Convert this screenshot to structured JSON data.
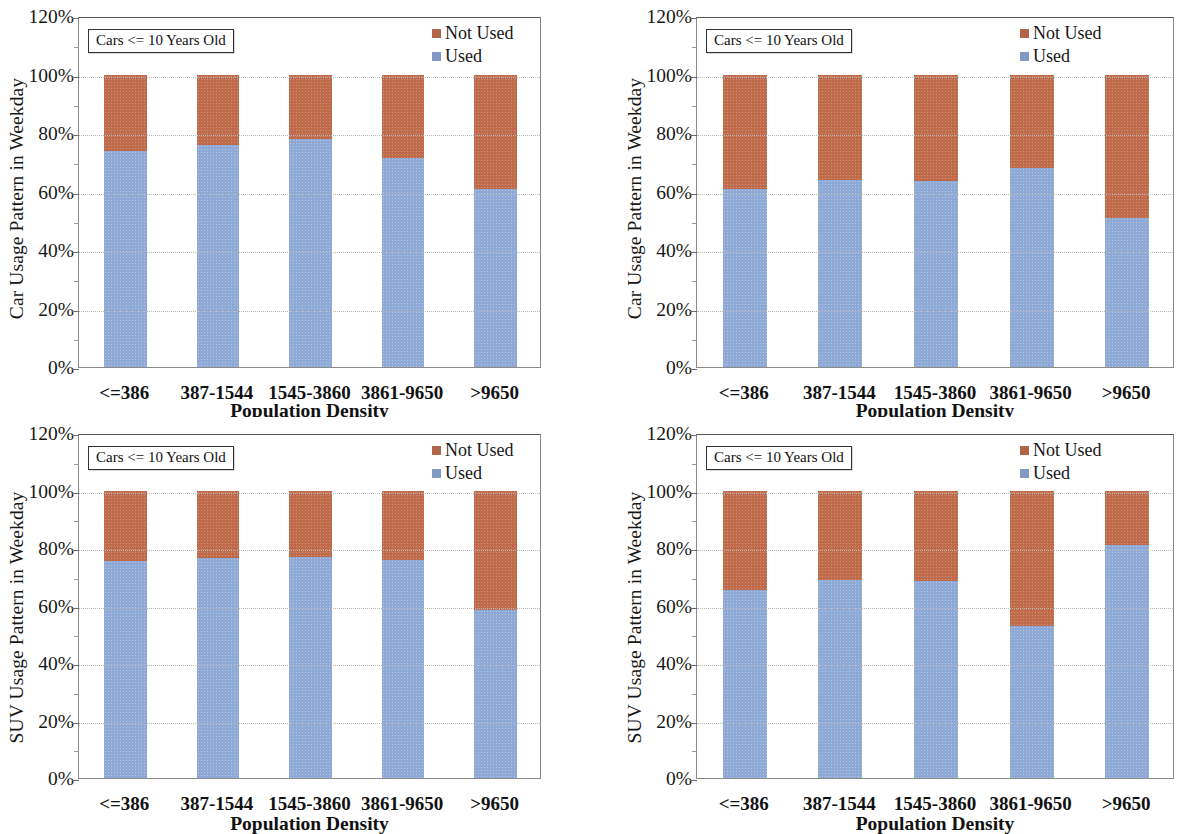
{
  "figure": {
    "panel_count": 4,
    "legend": {
      "items": [
        {
          "label": "Not Used",
          "color": "#b06448"
        },
        {
          "label": "Used",
          "color": "#8299c4"
        }
      ]
    },
    "annotation": "Cars <= 10 Years Old",
    "y_ticks": [
      "0%",
      "20%",
      "40%",
      "60%",
      "80%",
      "100%",
      "120%"
    ],
    "x_title": "Population Density",
    "categories": [
      "<=386",
      "387-1544",
      "1545-3860",
      "3861-9650",
      ">9650"
    ]
  },
  "chart_data": [
    {
      "type": "bar",
      "stacked": true,
      "panel": "top-left",
      "title": "",
      "annotation": "Cars <= 10 Years Old",
      "xlabel": "Population Density",
      "ylabel": "Car Usage Pattern in Weekday",
      "categories": [
        "<=386",
        "387-1544",
        "1545-3860",
        "3861-9650",
        ">9650"
      ],
      "series": [
        {
          "name": "Used",
          "color": "#8ea9d6",
          "values": [
            74,
            76,
            78,
            71.5,
            61
          ]
        },
        {
          "name": "Not Used",
          "color": "#bf6a4a",
          "values": [
            26,
            24,
            22,
            28.5,
            39
          ]
        }
      ],
      "ylim": [
        0,
        120
      ],
      "ytick_step": 20,
      "grid": true,
      "legend_position": "top-right"
    },
    {
      "type": "bar",
      "stacked": true,
      "panel": "top-right",
      "title": "",
      "annotation": "Cars <= 10 Years Old",
      "xlabel": "Population Density",
      "ylabel": "Car Usage Pattern in Weekday",
      "categories": [
        "<=386",
        "387-1544",
        "1545-3860",
        "3861-9650",
        ">9650"
      ],
      "series": [
        {
          "name": "Used",
          "color": "#8ea9d6",
          "values": [
            61,
            64,
            63.5,
            68,
            51
          ]
        },
        {
          "name": "Not Used",
          "color": "#bf6a4a",
          "values": [
            39,
            36,
            36.5,
            32,
            49
          ]
        }
      ],
      "ylim": [
        0,
        120
      ],
      "ytick_step": 20,
      "grid": true,
      "legend_position": "top-right"
    },
    {
      "type": "bar",
      "stacked": true,
      "panel": "bottom-left",
      "title": "",
      "annotation": "Cars <= 10 Years Old",
      "xlabel": "Population Density",
      "ylabel": "SUV Usage Pattern in Weekday",
      "categories": [
        "<=386",
        "387-1544",
        "1545-3860",
        "3861-9650",
        ">9650"
      ],
      "series": [
        {
          "name": "Used",
          "color": "#8ea9d6",
          "values": [
            75.5,
            76.5,
            77,
            76,
            58.5
          ]
        },
        {
          "name": "Not Used",
          "color": "#bf6a4a",
          "values": [
            24.5,
            23.5,
            23,
            24,
            41.5
          ]
        }
      ],
      "ylim": [
        0,
        120
      ],
      "ytick_step": 20,
      "grid": true,
      "legend_position": "top-right"
    },
    {
      "type": "bar",
      "stacked": true,
      "panel": "bottom-right",
      "title": "",
      "annotation": "Cars <= 10 Years Old",
      "xlabel": "Population Density",
      "ylabel": "SUV Usage Pattern in Weekday",
      "categories": [
        "<=386",
        "387-1544",
        "1545-3860",
        "3861-9650",
        ">9650"
      ],
      "series": [
        {
          "name": "Used",
          "color": "#8ea9d6",
          "values": [
            65.5,
            69,
            68.5,
            53,
            81
          ]
        },
        {
          "name": "Not Used",
          "color": "#bf6a4a",
          "values": [
            34.5,
            31,
            31.5,
            47,
            19
          ]
        }
      ],
      "ylim": [
        0,
        120
      ],
      "ytick_step": 20,
      "grid": true,
      "legend_position": "top-right"
    }
  ]
}
